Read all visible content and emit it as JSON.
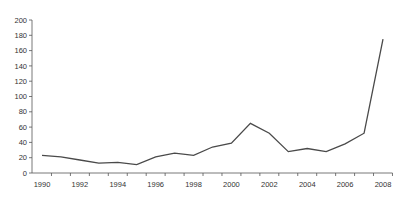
{
  "chart_data": {
    "type": "line",
    "title": "",
    "xlabel": "",
    "ylabel": "",
    "x": [
      1990,
      1991,
      1992,
      1993,
      1994,
      1995,
      1996,
      1997,
      1998,
      1999,
      2000,
      2001,
      2002,
      2003,
      2004,
      2005,
      2006,
      2007,
      2008
    ],
    "series": [
      {
        "name": "",
        "values": [
          23,
          21,
          17,
          13,
          14,
          11,
          21,
          26,
          23,
          34,
          39,
          65,
          52,
          28,
          32,
          28,
          38,
          52,
          175
        ]
      }
    ],
    "ylim": [
      0,
      200
    ],
    "xlim": [
      1990,
      2008
    ],
    "y_ticks": [
      0,
      20,
      40,
      60,
      80,
      100,
      120,
      140,
      160,
      180,
      200
    ],
    "x_tick_labels": [
      "1990",
      "1992",
      "1994",
      "1996",
      "1998",
      "2000",
      "2002",
      "2004",
      "2006",
      "2008"
    ],
    "grid": false,
    "legend": null,
    "colors": {
      "line": "#4a4a4a",
      "axis": "#555555",
      "text": "#333333"
    }
  }
}
